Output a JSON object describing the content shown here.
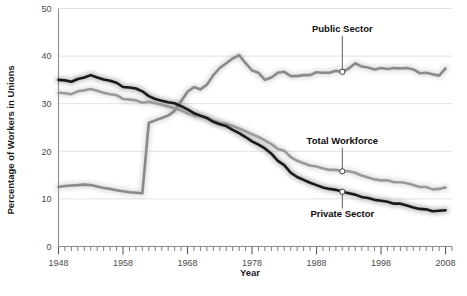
{
  "chart_data": {
    "type": "line",
    "title": "",
    "xlabel": "Year",
    "ylabel": "Percentage of Workers in Unions",
    "xlim": [
      1948,
      2009
    ],
    "ylim": [
      0,
      50
    ],
    "yticks": [
      0,
      10,
      20,
      30,
      40,
      50
    ],
    "ytick_labels": [
      "0",
      "10",
      "20",
      "30",
      "40",
      "50"
    ],
    "xticks": [
      1948,
      1958,
      1968,
      1978,
      1988,
      1998,
      2008
    ],
    "xtick_labels": [
      "1948",
      "1958",
      "1968",
      "1978",
      "1988",
      "1998",
      "2008"
    ],
    "minor_xtick_interval": 1,
    "grid": "horizontal",
    "legend_position": "inline-annotations",
    "x": [
      1948,
      1949,
      1950,
      1951,
      1952,
      1953,
      1954,
      1955,
      1956,
      1957,
      1958,
      1959,
      1960,
      1961,
      1962,
      1963,
      1964,
      1965,
      1966,
      1967,
      1968,
      1969,
      1970,
      1971,
      1972,
      1973,
      1974,
      1975,
      1976,
      1977,
      1978,
      1979,
      1980,
      1981,
      1982,
      1983,
      1984,
      1985,
      1986,
      1987,
      1988,
      1989,
      1990,
      1991,
      1992,
      1993,
      1994,
      1995,
      1996,
      1997,
      1998,
      1999,
      2000,
      2001,
      2002,
      2003,
      2004,
      2005,
      2006,
      2007,
      2008
    ],
    "series": [
      {
        "name": "Public Sector",
        "color": "#8a8a8a",
        "values": [
          12.5,
          12.7,
          12.8,
          12.9,
          13.0,
          12.9,
          12.6,
          12.3,
          12.1,
          11.8,
          11.6,
          11.4,
          11.3,
          11.2,
          26.0,
          26.5,
          27.0,
          27.5,
          28.5,
          30.5,
          32.5,
          33.5,
          33.0,
          34.0,
          36.0,
          37.5,
          38.5,
          39.5,
          40.2,
          38.5,
          37.0,
          36.5,
          35.0,
          35.5,
          36.5,
          36.7,
          35.8,
          35.8,
          36.0,
          36.0,
          36.6,
          36.5,
          36.5,
          36.9,
          36.7,
          37.4,
          38.5,
          37.8,
          37.6,
          37.2,
          37.5,
          37.3,
          37.5,
          37.4,
          37.5,
          37.2,
          36.4,
          36.5,
          36.2,
          35.9,
          37.4
        ]
      },
      {
        "name": "Total Workforce",
        "color": "#9a9a9a",
        "values": [
          32.3,
          32.2,
          32.0,
          32.6,
          32.8,
          33.1,
          32.7,
          32.3,
          32.0,
          31.8,
          31.0,
          30.9,
          30.7,
          30.2,
          30.4,
          30.1,
          29.8,
          29.4,
          29.0,
          28.6,
          28.0,
          27.5,
          27.3,
          27.0,
          26.4,
          26.0,
          25.8,
          25.3,
          24.8,
          24.2,
          23.6,
          23.0,
          22.3,
          21.5,
          20.5,
          20.1,
          18.8,
          18.0,
          17.5,
          17.0,
          16.8,
          16.4,
          16.1,
          16.1,
          15.8,
          15.8,
          15.5,
          14.9,
          14.5,
          14.1,
          13.9,
          13.9,
          13.5,
          13.5,
          13.3,
          12.9,
          12.5,
          12.5,
          12.0,
          12.1,
          12.4
        ]
      },
      {
        "name": "Private Sector",
        "color": "#1a1a1a",
        "values": [
          35.0,
          34.9,
          34.6,
          35.2,
          35.5,
          36.0,
          35.5,
          35.1,
          34.8,
          34.4,
          33.5,
          33.4,
          33.2,
          32.6,
          31.6,
          31.0,
          30.6,
          30.3,
          30.1,
          29.5,
          28.8,
          28.0,
          27.5,
          27.0,
          26.2,
          25.7,
          25.3,
          24.5,
          23.8,
          23.0,
          22.1,
          21.4,
          20.6,
          19.5,
          18.0,
          17.1,
          15.5,
          14.6,
          14.0,
          13.4,
          12.9,
          12.4,
          12.1,
          11.9,
          11.5,
          11.2,
          10.9,
          10.4,
          10.2,
          9.8,
          9.6,
          9.4,
          9.0,
          9.0,
          8.6,
          8.2,
          7.9,
          7.8,
          7.4,
          7.5,
          7.6
        ]
      }
    ],
    "annotations": [
      {
        "label": "Public Sector",
        "series": "Public Sector",
        "x": 1992,
        "y": 36.7,
        "label_x": 1992,
        "label_y": 45.0
      },
      {
        "label": "Total Workforce",
        "series": "Total Workforce",
        "x": 1992,
        "y": 15.8,
        "label_x": 1992,
        "label_y": 21.5
      },
      {
        "label": "Private Sector",
        "series": "Private Sector",
        "x": 1992,
        "y": 11.5,
        "label_x": 1992,
        "label_y": 6.2
      }
    ]
  }
}
